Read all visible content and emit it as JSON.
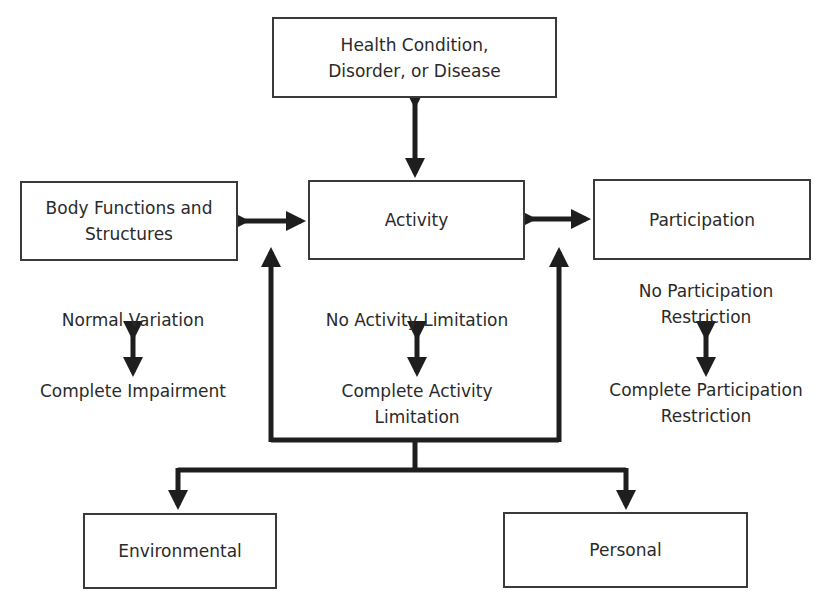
{
  "diagram": {
    "nodes": {
      "health_condition": {
        "line1": "Health Condition,",
        "line2": "Disorder, or Disease"
      },
      "body_functions": {
        "line1": "Body Functions and",
        "line2": "Structures"
      },
      "activity": {
        "label": "Activity"
      },
      "participation": {
        "label": "Participation"
      },
      "environmental": {
        "label": "Environmental"
      },
      "personal": {
        "label": "Personal"
      }
    },
    "scales": {
      "body": {
        "top": "Normal Variation",
        "bottom": "Complete Impairment"
      },
      "activity": {
        "top": "No Activity Limitation",
        "bottom_line1": "Complete Activity",
        "bottom_line2": "Limitation"
      },
      "participation": {
        "top_line1": "No Participation",
        "top_line2": "Restriction",
        "bottom_line1": "Complete Participation",
        "bottom_line2": "Restriction"
      }
    },
    "edges": [
      {
        "from": "health_condition",
        "to": "activity",
        "type": "bidirectional"
      },
      {
        "from": "body_functions",
        "to": "activity",
        "type": "bidirectional"
      },
      {
        "from": "activity",
        "to": "participation",
        "type": "bidirectional"
      },
      {
        "from": "contextual_factors",
        "to": "body_functions/activity",
        "type": "directed"
      },
      {
        "from": "contextual_factors",
        "to": "participation/activity",
        "type": "directed"
      },
      {
        "from": "contextual_factors",
        "to": "environmental",
        "type": "directed"
      },
      {
        "from": "contextual_factors",
        "to": "personal",
        "type": "directed"
      }
    ]
  }
}
